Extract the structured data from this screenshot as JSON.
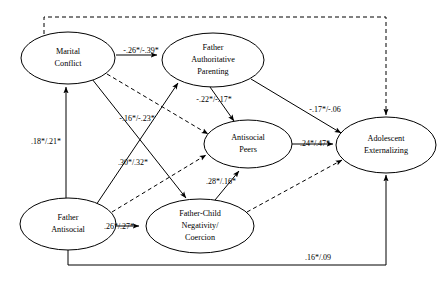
{
  "diagram": {
    "type": "path-model",
    "nodes": [
      {
        "id": "marital_conflict",
        "label_lines": [
          "Marital",
          "Conflict"
        ],
        "cx": 68,
        "cy": 58,
        "rx": 47,
        "ry": 26
      },
      {
        "id": "father_authoritative_parenting",
        "label_lines": [
          "Father",
          "Authoritative",
          "Parenting"
        ],
        "cx": 213,
        "cy": 60,
        "rx": 51,
        "ry": 27
      },
      {
        "id": "antisocial_peers",
        "label_lines": [
          "Antisocial",
          "Peers"
        ],
        "cx": 248,
        "cy": 144,
        "rx": 44,
        "ry": 24
      },
      {
        "id": "adolescent_externalizing",
        "label_lines": [
          "Adolescent",
          "Externalizing"
        ],
        "cx": 386,
        "cy": 145,
        "rx": 50,
        "ry": 28
      },
      {
        "id": "father_antisocial",
        "label_lines": [
          "Father",
          "Antisocial"
        ],
        "cx": 68,
        "cy": 224,
        "rx": 48,
        "ry": 26
      },
      {
        "id": "father_child_negativity",
        "label_lines": [
          "Father-Child",
          "Negativity/",
          "Coercion"
        ],
        "cx": 200,
        "cy": 226,
        "rx": 54,
        "ry": 27
      }
    ],
    "paths": [
      {
        "id": "marital-to-parenting",
        "from": "marital_conflict",
        "to": "father_authoritative_parenting",
        "style": "solid",
        "coefficient": "-.26*/-.39*",
        "label_x": 141,
        "label_y": 51
      },
      {
        "id": "parenting-to-peers",
        "from": "father_authoritative_parenting",
        "to": "antisocial_peers",
        "style": "solid",
        "coefficient": "-.22*/-.17*",
        "label_x": 214,
        "label_y": 100
      },
      {
        "id": "parenting-to-externalizing",
        "from": "father_authoritative_parenting",
        "to": "adolescent_externalizing",
        "style": "solid",
        "coefficient": "-.17*/-.06",
        "label_x": 325,
        "label_y": 110
      },
      {
        "id": "peers-to-externalizing",
        "from": "antisocial_peers",
        "to": "adolescent_externalizing",
        "style": "solid",
        "coefficient": ".24*/.47*",
        "label_x": 315,
        "label_y": 144
      },
      {
        "id": "antisocial-to-marital",
        "from": "father_antisocial",
        "to": "marital_conflict",
        "style": "solid",
        "coefficient": ".18*/.21*",
        "label_x": 46,
        "label_y": 142
      },
      {
        "id": "antisocial-to-parenting",
        "from": "father_antisocial",
        "to": "father_authoritative_parenting",
        "style": "solid",
        "coefficient": "-.16*/-.23*",
        "label_x": 137,
        "label_y": 119
      },
      {
        "id": "marital-to-negativity",
        "from": "marital_conflict",
        "to": "father_child_negativity",
        "style": "solid",
        "coefficient": ".30*/.32*",
        "label_x": 133,
        "label_y": 163
      },
      {
        "id": "negativity-to-peers",
        "from": "father_child_negativity",
        "to": "antisocial_peers",
        "style": "solid",
        "coefficient": ".28*/.16*",
        "label_x": 221,
        "label_y": 182
      },
      {
        "id": "antisocial-to-negativity",
        "from": "father_antisocial",
        "to": "father_child_negativity",
        "style": "solid",
        "coefficient": ".26*/.27*",
        "label_x": 119,
        "label_y": 227
      },
      {
        "id": "antisocial-to-externalizing-bottom",
        "from": "father_antisocial",
        "to": "adolescent_externalizing",
        "style": "solid",
        "coefficient": ".16*/.09",
        "label_x": 318,
        "label_y": 258
      },
      {
        "id": "marital-to-externalizing-top",
        "from": "marital_conflict",
        "to": "adolescent_externalizing",
        "style": "dashed",
        "coefficient": "",
        "label_x": 0,
        "label_y": 0
      },
      {
        "id": "marital-to-peers-dashed",
        "from": "marital_conflict",
        "to": "antisocial_peers",
        "style": "dashed",
        "coefficient": "",
        "label_x": 0,
        "label_y": 0
      },
      {
        "id": "antisocial-to-peers-dashed",
        "from": "father_antisocial",
        "to": "antisocial_peers",
        "style": "dashed",
        "coefficient": "",
        "label_x": 0,
        "label_y": 0
      },
      {
        "id": "negativity-to-externalizing-dashed",
        "from": "father_child_negativity",
        "to": "adolescent_externalizing",
        "style": "dashed",
        "coefficient": "",
        "label_x": 0,
        "label_y": 0
      }
    ]
  }
}
